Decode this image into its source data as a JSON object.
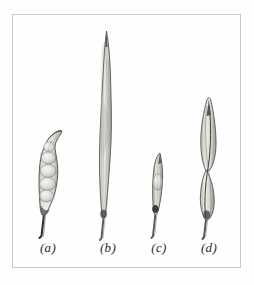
{
  "plate": {
    "kind": "botanical-illustration-plate",
    "medium": "pencil-and-ink-hatching",
    "background_color": "#fefefe",
    "frame_color": "#c9c9c9",
    "ink_color": "#3a3a3a",
    "shade_color": "#b9b9b6",
    "specimen_count": 4
  },
  "specimens": [
    {
      "key": "a",
      "label": "(a)",
      "description": "short lumpy seed pod with visible seed bulges and curved hooked tip on a thin stalk",
      "shape": "torulose-pod",
      "relative_height": "short",
      "seed_bulges": 5,
      "tip": "curved-hooked",
      "top_y": 130,
      "bottom_y": 235,
      "center_x": 48,
      "max_width": 26
    },
    {
      "key": "b",
      "label": "(b)",
      "description": "very long slender pod with sharply pointed tip and fine longitudinal striations",
      "shape": "linear-elongate-pod",
      "relative_height": "tallest",
      "seed_bulges": 0,
      "tip": "sharp-acuminate",
      "top_y": 30,
      "bottom_y": 235,
      "center_x": 106,
      "max_width": 16
    },
    {
      "key": "c",
      "label": "(c)",
      "description": "small narrow spindle-shaped pod with slight central bulge",
      "shape": "narrow-fusiform-pod",
      "relative_height": "shortest",
      "seed_bulges": 1,
      "tip": "sharp-acute",
      "top_y": 152,
      "bottom_y": 235,
      "center_x": 158,
      "max_width": 13
    },
    {
      "key": "d",
      "label": "(d)",
      "description": "broad lance-shaped pod with distinct mid-body constriction forming two lobes",
      "shape": "constricted-lanceolate-pod",
      "relative_height": "tall",
      "seed_bulges": 2,
      "tip": "sharp-acuminate",
      "top_y": 100,
      "bottom_y": 235,
      "center_x": 209,
      "max_width": 26
    }
  ]
}
